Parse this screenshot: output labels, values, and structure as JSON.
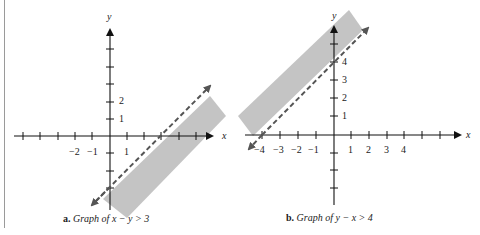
{
  "figures": [
    {
      "id": "a",
      "caption_letter": "a.",
      "caption_text": "Graph of x − y > 3",
      "inequality": "x - y > 3",
      "boundary_line": "x - y = 3",
      "boundary_style": "dashed",
      "shaded_side": "below-right",
      "x_axis_label": "x",
      "y_axis_label": "y",
      "x_tick_labels": [
        "−2",
        "−1",
        "1"
      ],
      "y_tick_labels": [
        "1",
        "2"
      ]
    },
    {
      "id": "b",
      "caption_letter": "b.",
      "caption_text": "Graph of y − x > 4",
      "inequality": "y - x > 4",
      "boundary_line": "y - x = 4",
      "boundary_style": "dashed",
      "shaded_side": "above-left",
      "x_axis_label": "x",
      "y_axis_label": "y",
      "x_tick_labels": [
        "−4",
        "−3",
        "−2",
        "−1",
        "1",
        "2",
        "3",
        "4"
      ],
      "y_tick_labels": [
        "1",
        "2",
        "3",
        "4"
      ]
    }
  ],
  "colors": {
    "shade": "#c4c4c4",
    "axis": "#111111",
    "dash": "#555555"
  }
}
